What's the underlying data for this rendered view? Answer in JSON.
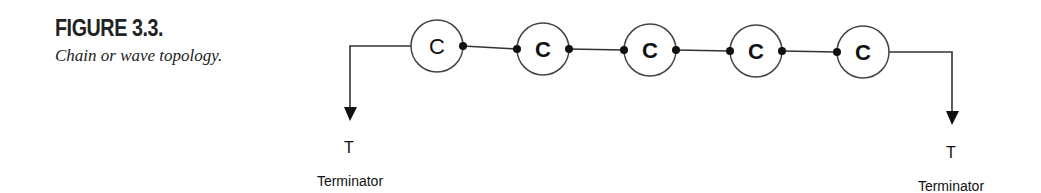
{
  "figure": {
    "label": "FIGURE 3.3.",
    "title": "Chain or wave topology."
  },
  "diagram": {
    "topology": "chain",
    "nodes": [
      {
        "label": "C",
        "connector_left": false,
        "connector_right": true
      },
      {
        "label": "C",
        "connector_left": true,
        "connector_right": true
      },
      {
        "label": "C",
        "connector_left": true,
        "connector_right": true
      },
      {
        "label": "C",
        "connector_left": true,
        "connector_right": true
      },
      {
        "label": "C",
        "connector_left": true,
        "connector_right": false
      }
    ],
    "terminators": {
      "left": {
        "symbol": "T",
        "label": "Terminator"
      },
      "right": {
        "symbol": "T",
        "label": "Terminator"
      }
    }
  }
}
